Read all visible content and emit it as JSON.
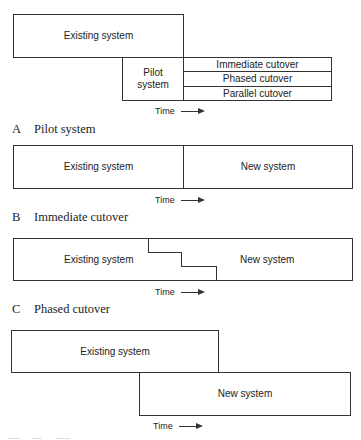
{
  "panels": {
    "a": {
      "letter": "A",
      "title": "Pilot system",
      "existing": "Existing system",
      "pilot": "Pilot\nsystem",
      "options": [
        "Immediate cutover",
        "Phased cutover",
        "Parallel cutover"
      ],
      "time": "Time"
    },
    "b": {
      "letter": "B",
      "title": "Immediate cutover",
      "existing": "Existing system",
      "new": "New system",
      "time": "Time"
    },
    "c": {
      "letter": "C",
      "title": "Phased cutover",
      "existing": "Existing system",
      "new": "New system",
      "time": "Time"
    },
    "d": {
      "existing": "Existing system",
      "new": "New system",
      "time": "Time",
      "caption_note": "caption cut off at image bottom; not legible"
    }
  }
}
